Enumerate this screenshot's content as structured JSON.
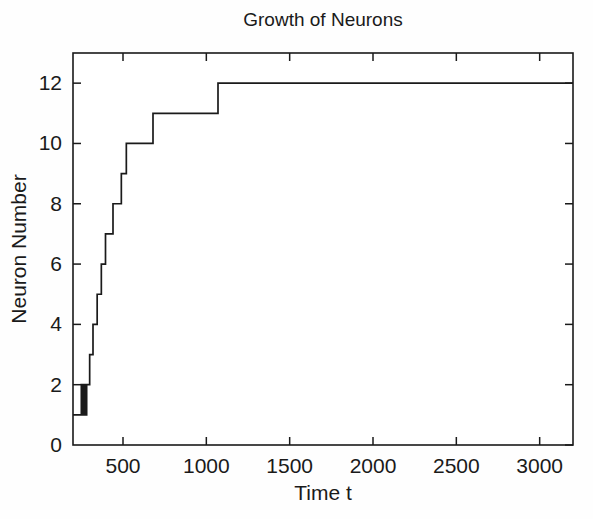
{
  "chart_data": {
    "type": "line",
    "title": "Growth of Neurons",
    "xlabel": "Time t",
    "ylabel": "Neuron Number",
    "xlim": [
      200,
      3200
    ],
    "ylim": [
      0,
      13
    ],
    "xticks": [
      500,
      1000,
      1500,
      2000,
      2500,
      3000
    ],
    "xtick_labels": [
      "500",
      "1000",
      "1500",
      "2000",
      "2500",
      "3000"
    ],
    "yticks": [
      0,
      2,
      4,
      6,
      8,
      10,
      12
    ],
    "ytick_labels": [
      "0",
      "2",
      "4",
      "6",
      "8",
      "10",
      "12"
    ],
    "grid": false,
    "legend": false,
    "line_style": "step-post",
    "series": [
      {
        "name": "Neuron Number",
        "color": "#1a1a1a",
        "x": [
          200,
          250,
          258,
          266,
          274,
          282,
          300,
          320,
          345,
          370,
          395,
          420,
          440,
          470,
          490,
          520,
          600,
          680,
          1070,
          3200
        ],
        "y": [
          1,
          2,
          1,
          2,
          1,
          2,
          3,
          4,
          5,
          6,
          7,
          7,
          8,
          8,
          9,
          10,
          10,
          11,
          12,
          12
        ]
      }
    ]
  },
  "axes": {
    "box_frame": true,
    "tick_direction": "in",
    "axis_color": "#1a1a1a",
    "background_color": "#ffffff"
  }
}
